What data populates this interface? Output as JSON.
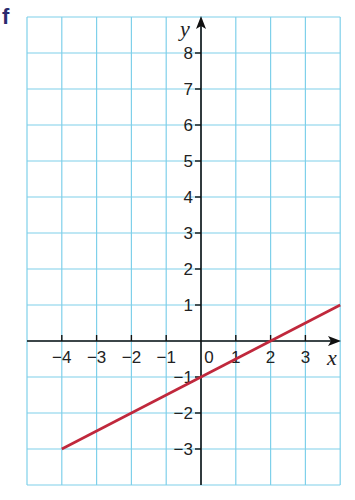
{
  "figure_label": "f",
  "colors": {
    "grid": "#7fd0ea",
    "axis": "#111111",
    "line": "#c0283c",
    "label": "#2a2a6e"
  },
  "chart_data": {
    "type": "line",
    "title": "",
    "xlabel": "x",
    "ylabel": "y",
    "xlim": [
      -5,
      4
    ],
    "ylim": [
      -4,
      9
    ],
    "grid": true,
    "x_ticks": [
      -4,
      -3,
      -2,
      -1,
      0,
      1,
      2,
      3
    ],
    "x_tick_labels": [
      "−4",
      "−3",
      "−2",
      "−1",
      "0",
      "1",
      "2",
      "3"
    ],
    "y_ticks": [
      -3,
      -2,
      -1,
      1,
      2,
      3,
      4,
      5,
      6,
      7,
      8
    ],
    "y_tick_labels": [
      "−3",
      "−2",
      "−1",
      "1",
      "2",
      "3",
      "4",
      "5",
      "6",
      "7",
      "8"
    ],
    "series": [
      {
        "name": "line",
        "x": [
          -4,
          4
        ],
        "y": [
          -3,
          1
        ],
        "equation": "y = 0.5x - 1"
      }
    ]
  }
}
